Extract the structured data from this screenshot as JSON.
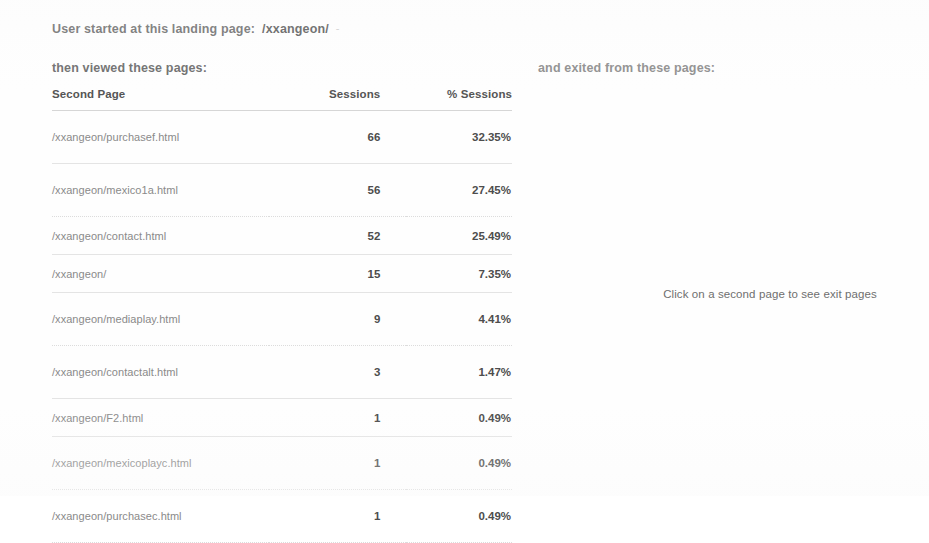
{
  "report": {
    "landing_label": "User started at this landing page:",
    "landing_page": "/xxangeon/",
    "landing_trailing_mark": "-",
    "then_viewed_heading": "then viewed these pages:",
    "exited_heading": "and exited from these pages:",
    "exit_hint": "Click on a second page to see exit pages"
  },
  "table": {
    "columns": {
      "page": "Second Page",
      "sessions": "Sessions",
      "pct_sessions": "% Sessions"
    },
    "rows": [
      {
        "page": "/xxangeon/purchasef.html",
        "sessions": "66",
        "pct": "32.35%"
      },
      {
        "page": "/xxangeon/mexico1a.html",
        "sessions": "56",
        "pct": "27.45%"
      },
      {
        "page": "/xxangeon/contact.html",
        "sessions": "52",
        "pct": "25.49%"
      },
      {
        "page": "/xxangeon/",
        "sessions": "15",
        "pct": "7.35%"
      },
      {
        "page": "/xxangeon/mediaplay.html",
        "sessions": "9",
        "pct": "4.41%"
      },
      {
        "page": "/xxangeon/contactalt.html",
        "sessions": "3",
        "pct": "1.47%"
      },
      {
        "page": "/xxangeon/F2.html",
        "sessions": "1",
        "pct": "0.49%"
      },
      {
        "page": "/xxangeon/mexicoplayc.html",
        "sessions": "1",
        "pct": "0.49%"
      },
      {
        "page": "/xxangeon/purchasec.html",
        "sessions": "1",
        "pct": "0.49%"
      }
    ]
  },
  "colors": {
    "page_background": "#fefefe",
    "heading_text": "#5e5e5e",
    "secondary_heading_text": "#8c8c8c",
    "url_text": "#8a8a8a",
    "value_text": "#4d4d4d",
    "rule": "#e4e4e4"
  }
}
